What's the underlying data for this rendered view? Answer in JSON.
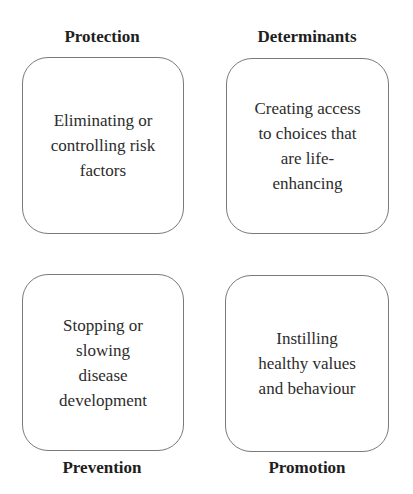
{
  "diagram": {
    "quadrants": [
      {
        "id": "protection",
        "label": "Protection",
        "label_position": "top",
        "description": "Eliminating or\ncontrolling risk\nfactors"
      },
      {
        "id": "determinants",
        "label": "Determinants",
        "label_position": "top",
        "description": "Creating access\nto choices that\nare life-\nenhancing"
      },
      {
        "id": "prevention",
        "label": "Prevention",
        "label_position": "bottom",
        "description": "Stopping or\nslowing\ndisease\ndevelopment"
      },
      {
        "id": "promotion",
        "label": "Promotion",
        "label_position": "bottom",
        "description": "Instilling\nhealthy values\nand behaviour"
      }
    ],
    "colors": {
      "border": "#7a7a7a",
      "text": "#2c2c2c",
      "label": "#1e1e1e",
      "background": "#ffffff"
    }
  }
}
